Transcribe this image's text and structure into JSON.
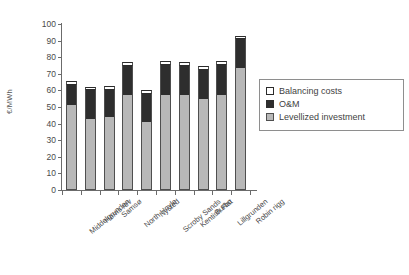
{
  "chart_data": {
    "type": "bar",
    "subtype": "stacked-column",
    "title": "",
    "xlabel": "",
    "ylabel": "€/MWh",
    "ylim": [
      0,
      100
    ],
    "ytick_step": 10,
    "yticks": [
      100,
      90,
      80,
      70,
      60,
      50,
      40,
      30,
      20,
      10,
      0
    ],
    "grid": false,
    "legend_position": "right",
    "categories": [
      "Middelgrunden",
      "Horns rev",
      "Samsø",
      "North Hoyle",
      "Nysted",
      "Scroby Sands",
      "Kentish Flat",
      "Burbo",
      "Lillgrunden",
      "Robin rigg"
    ],
    "series": [
      {
        "name": "Levellized investment",
        "color": "#b8b8b8",
        "values": [
          51,
          43,
          44,
          57.5,
          41,
          57.5,
          57.5,
          55,
          57.5,
          73.5
        ]
      },
      {
        "name": "O&M",
        "color": "#2e2e2e",
        "values": [
          12.5,
          17,
          16,
          17.5,
          17,
          18,
          17.5,
          17.5,
          18,
          17.5
        ]
      },
      {
        "name": "Balancing costs",
        "color": "#ffffff",
        "values": [
          2,
          2,
          2.5,
          2,
          2,
          2,
          2,
          2,
          2,
          1.5
        ]
      }
    ],
    "totals": [
      65.5,
      62,
      62.5,
      77,
      60,
      77.5,
      77,
      74.5,
      77.5,
      92.5
    ]
  },
  "legend": {
    "entries": [
      {
        "label": "Balancing costs",
        "swatch": "white-square-icon"
      },
      {
        "label": "O&M",
        "swatch": "black-square-icon"
      },
      {
        "label": "Levellized investment",
        "swatch": "gray-square-icon"
      }
    ]
  }
}
